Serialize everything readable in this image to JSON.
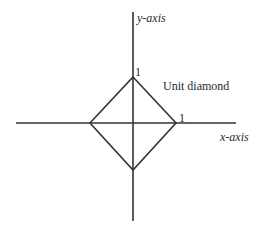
{
  "diagram": {
    "title": "Unit diamond",
    "axes": {
      "x_label": "x-axis",
      "y_label": "y-axis"
    },
    "tick_labels": {
      "x_one": "1",
      "y_one": "1"
    },
    "shape_label": "Unit diamond",
    "colors": {
      "line": "#333333",
      "text": "#2a2a2a",
      "background": "#ffffff"
    }
  }
}
